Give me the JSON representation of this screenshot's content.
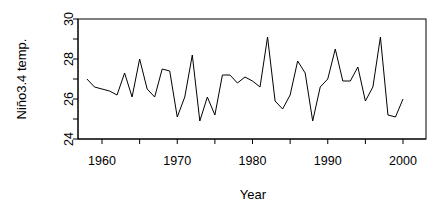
{
  "chart_data": {
    "type": "line",
    "title": "",
    "xlabel": "Year",
    "ylabel": "Niño3.4 temp.",
    "xlim": [
      1957.5,
      2000.5
    ],
    "ylim": [
      23.7,
      30.1
    ],
    "grid": false,
    "legend": null,
    "box": true,
    "x_ticks": [
      1960,
      1970,
      1980,
      1990,
      2000
    ],
    "x_tick_labels": [
      "1960",
      "1970",
      "1980",
      "1990",
      "2000"
    ],
    "x_minor_ticks": [
      1965,
      1975,
      1985,
      1995
    ],
    "y_ticks": [
      24,
      26,
      28,
      30
    ],
    "y_tick_labels": [
      "24",
      "26",
      "28",
      "30"
    ],
    "y_minor_ticks": [
      25,
      27,
      29
    ],
    "line_color": "#000000",
    "line_width": 1,
    "x": [
      1958,
      1959,
      1960,
      1961,
      1962,
      1963,
      1964,
      1965,
      1966,
      1967,
      1968,
      1969,
      1970,
      1971,
      1972,
      1973,
      1974,
      1975,
      1976,
      1977,
      1978,
      1979,
      1980,
      1981,
      1982,
      1983,
      1984,
      1985,
      1986,
      1987,
      1988,
      1989,
      1990,
      1991,
      1992,
      1993,
      1994,
      1995,
      1996,
      1997,
      1998,
      1999,
      2000
    ],
    "y": [
      27.0,
      26.6,
      26.5,
      26.4,
      26.2,
      27.3,
      26.1,
      28.0,
      26.5,
      26.1,
      27.5,
      27.4,
      25.1,
      26.1,
      28.2,
      24.9,
      26.1,
      25.2,
      27.2,
      27.2,
      26.8,
      27.1,
      26.9,
      26.6,
      29.1,
      25.9,
      25.5,
      26.2,
      27.9,
      27.3,
      24.9,
      26.6,
      27.0,
      28.5,
      26.9,
      26.9,
      27.6,
      25.9,
      26.6,
      29.1,
      25.2,
      25.1,
      26.0
    ],
    "series": [
      {
        "name": "Niño3.4 temp.",
        "values": [
          27.0,
          26.6,
          26.5,
          26.4,
          26.2,
          27.3,
          26.1,
          28.0,
          26.5,
          26.1,
          27.5,
          27.4,
          25.1,
          26.1,
          28.2,
          24.9,
          26.1,
          25.2,
          27.2,
          27.2,
          26.8,
          27.1,
          26.9,
          26.6,
          29.1,
          25.9,
          25.5,
          26.2,
          27.9,
          27.3,
          24.9,
          26.6,
          27.0,
          28.5,
          26.9,
          26.9,
          27.6,
          25.9,
          26.6,
          29.1,
          25.2,
          25.1,
          26.0
        ]
      }
    ]
  }
}
